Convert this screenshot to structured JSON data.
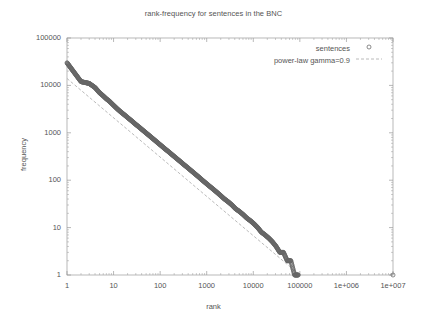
{
  "chart_data": {
    "type": "scatter",
    "title": "rank-frequency for sentences in the BNC",
    "xlabel": "rank",
    "ylabel": "frequency",
    "xscale": "log",
    "yscale": "log",
    "xlim": [
      1,
      10000000
    ],
    "ylim": [
      1,
      100000
    ],
    "grid": false,
    "legend_position": "top-right",
    "xticks": [
      {
        "value": 1,
        "label": "1"
      },
      {
        "value": 10,
        "label": "10"
      },
      {
        "value": 100,
        "label": "100"
      },
      {
        "value": 1000,
        "label": "1000"
      },
      {
        "value": 10000,
        "label": "10000"
      },
      {
        "value": 100000,
        "label": "100000"
      },
      {
        "value": 1000000,
        "label": "1e+006"
      },
      {
        "value": 10000000,
        "label": "1e+007"
      }
    ],
    "yticks": [
      {
        "value": 1,
        "label": "1"
      },
      {
        "value": 10,
        "label": "10"
      },
      {
        "value": 100,
        "label": "100"
      },
      {
        "value": 1000,
        "label": "1000"
      },
      {
        "value": 10000,
        "label": "10000"
      },
      {
        "value": 100000,
        "label": "100000"
      }
    ],
    "series": [
      {
        "name": "sentences",
        "style": "points",
        "marker": "open-circle",
        "color": "#777777",
        "points": [
          [
            1,
            30000
          ],
          [
            2,
            12000
          ],
          [
            3,
            11000
          ],
          [
            4,
            9000
          ],
          [
            5,
            7000
          ],
          [
            6,
            6000
          ],
          [
            7,
            5200
          ],
          [
            8,
            4700
          ],
          [
            9,
            4200
          ],
          [
            10,
            3800
          ],
          [
            12,
            3200
          ],
          [
            14,
            2800
          ],
          [
            17,
            2400
          ],
          [
            20,
            2100
          ],
          [
            25,
            1750
          ],
          [
            30,
            1500
          ],
          [
            36,
            1300
          ],
          [
            43,
            1120
          ],
          [
            52,
            960
          ],
          [
            62,
            830
          ],
          [
            75,
            710
          ],
          [
            90,
            610
          ],
          [
            108,
            525
          ],
          [
            130,
            450
          ],
          [
            156,
            390
          ],
          [
            187,
            335
          ],
          [
            225,
            288
          ],
          [
            270,
            248
          ],
          [
            324,
            213
          ],
          [
            389,
            184
          ],
          [
            467,
            158
          ],
          [
            560,
            136
          ],
          [
            672,
            117
          ],
          [
            806,
            100
          ],
          [
            968,
            86
          ],
          [
            1162,
            74
          ],
          [
            1394,
            64
          ],
          [
            1673,
            55
          ],
          [
            2008,
            47
          ],
          [
            2410,
            40
          ],
          [
            2892,
            35
          ],
          [
            3470,
            30
          ],
          [
            4164,
            25
          ],
          [
            4997,
            22
          ],
          [
            5996,
            19
          ],
          [
            7195,
            16
          ],
          [
            8634,
            14
          ],
          [
            10361,
            12
          ],
          [
            12433,
            10
          ],
          [
            14920,
            8
          ],
          [
            17904,
            7
          ],
          [
            21485,
            6
          ],
          [
            25782,
            5
          ],
          [
            30938,
            4
          ],
          [
            37126,
            3
          ],
          [
            44551,
            3
          ],
          [
            53461,
            2
          ],
          [
            64153,
            2
          ],
          [
            76984,
            1
          ],
          [
            92381,
            1
          ],
          [
            10000000,
            1
          ]
        ]
      },
      {
        "name": "power-law gamma=0.9",
        "style": "dashed-line",
        "color": "#9c9c9c",
        "gamma": 0.9,
        "endpoints": [
          [
            1,
            14000
          ],
          [
            100000,
            1
          ]
        ]
      }
    ]
  },
  "legend": {
    "entries": [
      {
        "label": "sentences",
        "marker": "open-circle"
      },
      {
        "label": "power-law gamma=0.9",
        "marker": "dashed-line"
      }
    ]
  },
  "colors": {
    "axis": "#9a9a9a",
    "text": "#555555",
    "points": "#666666",
    "fit_line": "#a8a8a8",
    "background": "#ffffff"
  }
}
